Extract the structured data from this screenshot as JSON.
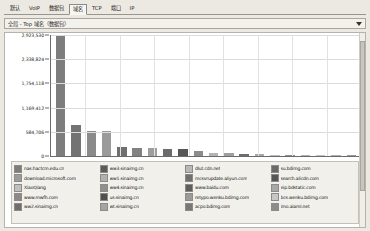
{
  "window": {
    "background_color": "#ece9e2",
    "panel_color": "#ffffff"
  },
  "tabs": [
    {
      "label": "默认",
      "selected": false
    },
    {
      "label": "VoIP",
      "selected": false
    },
    {
      "label": "数据包",
      "selected": false
    },
    {
      "label": "域名",
      "selected": true
    },
    {
      "label": "TCP",
      "selected": false
    },
    {
      "label": "端口",
      "selected": false
    },
    {
      "label": "IP",
      "selected": false
    }
  ],
  "selector": {
    "value": "全局 - Top 域名（数据包）",
    "arrow_icon": "chevron-down-icon"
  },
  "chart_data": {
    "type": "bar",
    "title": "全局 - Top 域名（数据包）",
    "xlabel": "",
    "ylabel": "",
    "ylim": [
      0,
      2923530
    ],
    "grid": true,
    "legend_position": "bottom",
    "ytick_labels": [
      "2,923,530",
      "2,338,824",
      "1,754,118",
      "1,169,412",
      "584,706",
      "0"
    ],
    "ytick_values": [
      2923530,
      2338824,
      1754118,
      1169412,
      584706,
      0
    ],
    "categories": [
      "nas.hactcm.edu.cn",
      "download.microsoft.com",
      "XiaoQiang",
      "www.mwfh.com",
      "ww2.sinaimg.cn",
      "ww3.sinaimg.cn",
      "ww1.sinaimg.cn",
      "ww4.sinaimg.cn",
      "us.sinaimg.cn",
      "wt.sinaimg.cn",
      "dlut.cdn.net",
      "mcsvrupdate.aliyun.com",
      "www.baidu.com",
      "retypo.wenku.bdimg.com",
      "acpo.bdimg.com",
      "su.bdimg.com",
      "search.alicdn.com",
      "eip.bdstatic.com",
      "bcs.wenku.bdimg.com",
      "imo.aiaml.net"
    ],
    "values": [
      2923530,
      750000,
      620000,
      610000,
      215000,
      205000,
      195000,
      180000,
      170000,
      120000,
      70000,
      62000,
      55000,
      42000,
      30000,
      22000,
      16000,
      12000,
      9000,
      6000
    ],
    "bar_colors": [
      "#7d7d7d",
      "#737373",
      "#8a8a8a",
      "#9a9a9a",
      "#6f6f6f",
      "#828282",
      "#9d9d9d",
      "#6b6b6b",
      "#565656",
      "#8c8c8c",
      "#b4b4b4",
      "#9f9f9f",
      "#6e6e6e",
      "#a8a8a8",
      "#bdbdbd",
      "#8f8f8f",
      "#b0b0b0",
      "#c2c2c2",
      "#aeaeae",
      "#999999"
    ]
  },
  "legend": {
    "columns": [
      {
        "items": [
          {
            "label": "nas.hactcm.edu.cn",
            "color": "#7d7d7d"
          },
          {
            "label": "download.microsoft.com",
            "color": "#9c9c9c"
          },
          {
            "label": "XiaoQiang",
            "color": "#c0c0c0"
          },
          {
            "label": "www.mwfh.com",
            "color": "#8a8a8a"
          },
          {
            "label": "ww2.sinaimg.cn",
            "color": "#6f6f6f"
          }
        ]
      },
      {
        "items": [
          {
            "label": "ww3.sinaimg.cn",
            "color": "#5a5a5a"
          },
          {
            "label": "ww1.sinaimg.cn",
            "color": "#b0b0b0"
          },
          {
            "label": "ww4.sinaimg.cn",
            "color": "#8f8f8f"
          },
          {
            "label": "us.sinaimg.cn",
            "color": "#4f4f4f"
          },
          {
            "label": "wt.sinaimg.cn",
            "color": "#a4a4a4"
          }
        ]
      },
      {
        "items": [
          {
            "label": "dlut.cdn.net",
            "color": "#b8b8b8"
          },
          {
            "label": "mcsvrupdate.aliyun.com",
            "color": "#707070"
          },
          {
            "label": "www.baidu.com",
            "color": "#5f5f5f"
          },
          {
            "label": "retypo.wenku.bdimg.com",
            "color": "#9a9a9a"
          },
          {
            "label": "acpo.bdimg.com",
            "color": "#787878"
          }
        ]
      },
      {
        "items": [
          {
            "label": "su.bdimg.com",
            "color": "#6a6a6a"
          },
          {
            "label": "search.alicdn.com",
            "color": "#565656"
          },
          {
            "label": "eip.bdstatic.com",
            "color": "#a8a8a8"
          },
          {
            "label": "bcs.wenku.bdimg.com",
            "color": "#c6c6c6"
          },
          {
            "label": "imo.aiaml.net",
            "color": "#8c8c8c"
          }
        ]
      }
    ]
  }
}
